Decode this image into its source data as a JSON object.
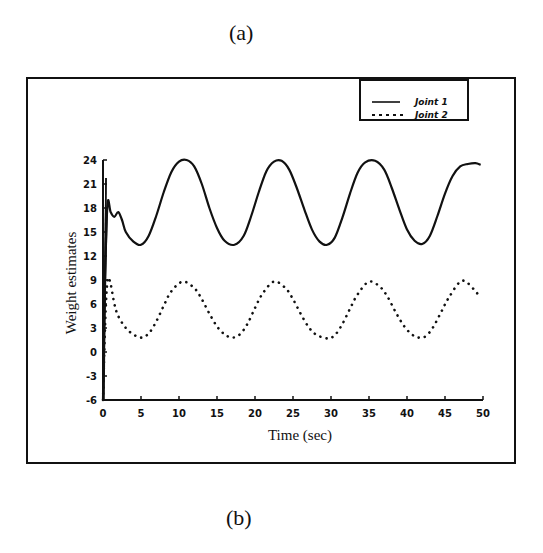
{
  "captions": {
    "top": "(a)",
    "bottom": "(b)"
  },
  "chart_data": {
    "type": "line",
    "title": "",
    "xlabel": "Time (sec)",
    "ylabel": "Weight estimates",
    "xlim": [
      0,
      50
    ],
    "ylim": [
      -6,
      24
    ],
    "xticks": [
      "0",
      "5",
      "10",
      "15",
      "20",
      "25",
      "30",
      "35",
      "40",
      "45",
      "50"
    ],
    "yticks": [
      "24",
      "21",
      "18",
      "15",
      "12",
      "9",
      "6",
      "3",
      "0",
      "-3",
      "-6"
    ],
    "grid": false,
    "legend_position": "top-right",
    "series": [
      {
        "name": "Joint 1",
        "style": "solid",
        "x": [
          0,
          0.3,
          0.6,
          1.0,
          1.5,
          2.0,
          2.5,
          3.0,
          4.0,
          5.0,
          6.0,
          7.0,
          8.0,
          9.0,
          10.0,
          11.0,
          12.0,
          13.0,
          14.0,
          15.0,
          16.0,
          17.3,
          18.5,
          19.5,
          20.5,
          21.5,
          22.5,
          23.5,
          24.5,
          25.5,
          26.5,
          27.5,
          28.5,
          29.5,
          30.5,
          31.5,
          32.5,
          33.5,
          34.5,
          35.8,
          37.0,
          38.0,
          39.0,
          40.0,
          41.0,
          42.0,
          43.0,
          44.0,
          45.0,
          46.0,
          47.0,
          48.0,
          49.0,
          49.7
        ],
        "y": [
          -6,
          10,
          18.6,
          17.5,
          16.9,
          17.5,
          16.5,
          15.0,
          13.8,
          13.4,
          14.5,
          17.0,
          20.0,
          22.5,
          23.8,
          24.0,
          23.2,
          21.0,
          18.0,
          15.5,
          13.9,
          13.4,
          14.5,
          17.0,
          20.0,
          22.6,
          23.8,
          23.9,
          22.8,
          20.5,
          17.8,
          15.3,
          13.8,
          13.4,
          14.3,
          16.8,
          19.8,
          22.4,
          23.7,
          23.9,
          22.8,
          20.5,
          17.8,
          15.3,
          13.9,
          13.5,
          14.5,
          17.0,
          19.8,
          22.0,
          23.2,
          23.5,
          23.6,
          23.4
        ]
      },
      {
        "name": "Joint 2",
        "style": "dotted",
        "x": [
          0,
          0.3,
          0.6,
          1.0,
          1.5,
          2.0,
          3.0,
          4.0,
          5.0,
          6.0,
          7.0,
          8.0,
          9.0,
          10.5,
          12.0,
          13.0,
          14.0,
          15.0,
          16.0,
          17.0,
          18.0,
          19.0,
          20.0,
          21.0,
          22.5,
          24.0,
          25.0,
          26.0,
          27.0,
          28.0,
          29.5,
          30.5,
          31.5,
          32.5,
          33.5,
          35.0,
          36.5,
          37.5,
          38.5,
          39.5,
          40.5,
          41.5,
          42.5,
          43.5,
          44.5,
          45.5,
          47.0,
          48.0,
          49.0,
          49.7
        ],
        "y": [
          -6,
          4,
          9.0,
          8.5,
          6.0,
          4.5,
          3.0,
          2.2,
          1.8,
          2.3,
          3.8,
          5.8,
          7.6,
          8.8,
          8.0,
          6.6,
          4.8,
          3.2,
          2.2,
          1.8,
          2.2,
          3.5,
          5.5,
          7.3,
          8.8,
          8.0,
          6.6,
          4.8,
          3.2,
          2.2,
          1.7,
          2.1,
          3.5,
          5.4,
          7.2,
          8.8,
          8.1,
          6.8,
          5.0,
          3.4,
          2.3,
          1.8,
          2.0,
          3.2,
          5.0,
          6.8,
          8.8,
          8.6,
          7.6,
          6.8
        ]
      }
    ]
  }
}
